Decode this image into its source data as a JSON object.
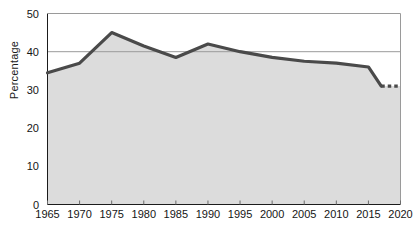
{
  "chart_data": {
    "type": "area",
    "title": "",
    "subtitle": "",
    "xlabel": "",
    "ylabel": "Percentage",
    "xlim": [
      1965,
      2020
    ],
    "ylim": [
      0,
      50
    ],
    "xticks": [
      1965,
      1970,
      1975,
      1980,
      1985,
      1990,
      1995,
      2000,
      2005,
      2010,
      2015,
      2020
    ],
    "yticks": [
      0,
      10,
      20,
      30,
      40,
      50
    ],
    "xtick_labels": [
      "1965",
      "1970",
      "1975",
      "1980",
      "1985",
      "1990",
      "1995",
      "2000",
      "2005",
      "2010",
      "2015",
      "2020"
    ],
    "ytick_labels": [
      "0",
      "10",
      "20",
      "30",
      "40",
      "50"
    ],
    "grid": "horizontal-single-at-40",
    "gridlines_y": [
      40
    ],
    "legend": "none",
    "series": [
      {
        "name": "Percentage",
        "style": "solid",
        "x": [
          1965,
          1970,
          1975,
          1980,
          1985,
          1990,
          1995,
          2000,
          2005,
          2010,
          2015,
          2017
        ],
        "values": [
          34.5,
          37.0,
          45.0,
          41.5,
          38.5,
          42.0,
          40.0,
          38.5,
          37.5,
          37.0,
          36.0,
          31.0
        ]
      },
      {
        "name": "Percentage (projected)",
        "style": "dashed",
        "x": [
          2017,
          2018,
          2019,
          2020
        ],
        "values": [
          31.0,
          31.0,
          31.0,
          31.0
        ]
      }
    ],
    "colors": {
      "line": "#4a4a4a",
      "fill": "#dcdcdc",
      "gridline": "#9a9a9a",
      "axis": "#1b1b1b",
      "background": "#ffffff"
    }
  }
}
